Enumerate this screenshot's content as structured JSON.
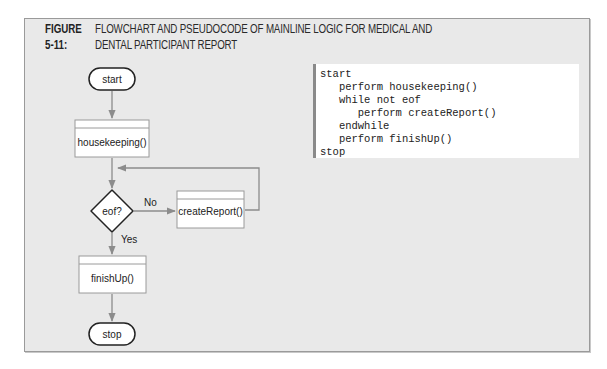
{
  "figure": {
    "label": "FIGURE 5-11:",
    "title": "FLOWCHART AND PSEUDOCODE OF MAINLINE LOGIC FOR MEDICAL AND DENTAL PARTICIPANT REPORT"
  },
  "flowchart": {
    "nodes": {
      "start": {
        "type": "terminal",
        "label": "start"
      },
      "housekeeping": {
        "type": "module",
        "label": "housekeeping()"
      },
      "eof": {
        "type": "decision",
        "label": "eof?"
      },
      "createReport": {
        "type": "module",
        "label": "createReport()"
      },
      "finishUp": {
        "type": "module",
        "label": "finishUp()"
      },
      "stop": {
        "type": "terminal",
        "label": "stop"
      }
    },
    "edges": {
      "start_to_housekeeping": {
        "from": "start",
        "to": "housekeeping",
        "label": ""
      },
      "housekeeping_to_eof": {
        "from": "housekeeping",
        "to": "eof",
        "label": ""
      },
      "eof_no": {
        "from": "eof",
        "to": "createReport",
        "label": "No"
      },
      "createReport_loop": {
        "from": "createReport",
        "to": "eof",
        "label": ""
      },
      "eof_yes": {
        "from": "eof",
        "to": "finishUp",
        "label": "Yes"
      },
      "finishUp_to_stop": {
        "from": "finishUp",
        "to": "stop",
        "label": ""
      }
    }
  },
  "pseudocode": {
    "lines": [
      "start",
      "   perform housekeeping()",
      "   while not eof",
      "      perform createReport()",
      "   endwhile",
      "   perform finishUp()",
      "stop"
    ]
  },
  "colors": {
    "panel_bg": "#e9e9e9",
    "arrow": "#8c8c8c",
    "shape_stroke": "#222222"
  }
}
